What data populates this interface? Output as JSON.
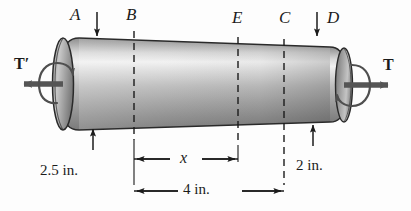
{
  "figure": {
    "background_color": "#fdfdfd",
    "ink_color": "#1b1b1b",
    "shaft_fill_light": "#f2f2f2",
    "shaft_fill_mid": "#b3b3b3",
    "shaft_fill_dark": "#6e6e6e",
    "arrow_color": "#555555"
  },
  "section_labels": {
    "a": "A",
    "b": "B",
    "e": "E",
    "c": "C",
    "d": "D"
  },
  "torque_labels": {
    "left": "T′",
    "right": "T"
  },
  "dimensions": {
    "left_diameter": "2.5 in.",
    "right_diameter": "2 in.",
    "partial_length": "x",
    "total_length": "4 in."
  },
  "icons": {
    "down_arrow_a": "down-arrow-icon",
    "down_arrow_d": "down-arrow-icon",
    "up_arrow_left_diameter": "up-arrow-icon",
    "up_arrow_right_diameter": "up-arrow-icon",
    "torque_arrow_left": "left-arrow-icon",
    "torque_arrow_right": "right-arrow-icon",
    "rotation_curl_left": "rotation-curl-icon",
    "rotation_curl_right": "rotation-curl-icon"
  }
}
